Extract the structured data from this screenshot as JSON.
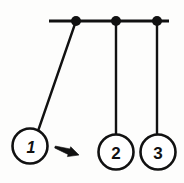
{
  "figure": {
    "background_color": "#fdfdfc",
    "stroke_color": "#111111",
    "fill_color": "#ffffff",
    "width": 184,
    "height": 183
  },
  "support_bar": {
    "name": "horizontal support bar",
    "x1": 49,
    "y1": 21,
    "x2": 169,
    "y2": 21,
    "thickness": 3.2
  },
  "pivots": [
    {
      "label": "pivot-1",
      "cx": 76,
      "cy": 21,
      "r": 5.0
    },
    {
      "label": "pivot-2",
      "cx": 116,
      "cy": 21,
      "r": 5.0
    },
    {
      "label": "pivot-3",
      "cx": 157,
      "cy": 21,
      "r": 5.0
    }
  ],
  "strings": [
    {
      "label": "string-1",
      "x1": 76,
      "y1": 21,
      "x2": 38,
      "y2": 131,
      "thickness": 2.4
    },
    {
      "label": "string-2",
      "x1": 116,
      "y1": 21,
      "x2": 116,
      "y2": 135,
      "thickness": 2.4
    },
    {
      "label": "string-3",
      "x1": 157,
      "y1": 21,
      "x2": 157,
      "y2": 135,
      "thickness": 2.4
    }
  ],
  "balls": [
    {
      "label": "1",
      "cx": 30,
      "cy": 146,
      "r": 17.5,
      "italic": true,
      "state": "raised-left"
    },
    {
      "label": "2",
      "cx": 116,
      "cy": 152,
      "r": 17.5,
      "italic": false,
      "state": "at-rest"
    },
    {
      "label": "3",
      "cx": 158,
      "cy": 152,
      "r": 17.5,
      "italic": false,
      "state": "at-rest"
    }
  ],
  "motion_arrow": {
    "name": "motion direction arrow",
    "direction": "right",
    "tail_x": 55,
    "tail_y": 147,
    "tip_x": 79,
    "tip_y": 155
  }
}
